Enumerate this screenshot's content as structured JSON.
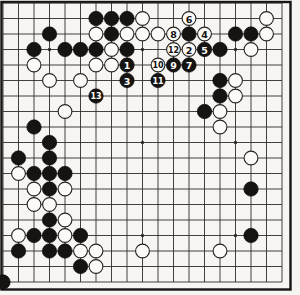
{
  "diagram": {
    "type": "go-board-diagram",
    "board_size": 19,
    "colors": {
      "paper": "#f6f5f1",
      "grid_line": "#2e2c29",
      "frame": "#171513",
      "black_stone": "#161412",
      "white_stone": "#fbfaf7",
      "white_stone_edge": "#25221f",
      "number_on_black": "#ffffff",
      "number_on_white": "#121110"
    },
    "geometry": {
      "origin_x": 3,
      "origin_y": 3,
      "cell": 15.5,
      "stone_radius": 7.2,
      "star_radius": 1.7,
      "frame": {
        "x": 1.5,
        "y": 2,
        "w": 289,
        "h": 287.5
      }
    },
    "star_points": [
      [
        3,
        3
      ],
      [
        9,
        3
      ],
      [
        15,
        3
      ],
      [
        9,
        9
      ],
      [
        15,
        9
      ],
      [
        9,
        15
      ],
      [
        15,
        15
      ]
    ],
    "black_stones": [
      [
        6,
        1
      ],
      [
        7,
        1
      ],
      [
        8,
        1
      ],
      [
        3,
        2
      ],
      [
        7,
        2
      ],
      [
        12,
        2
      ],
      [
        15,
        2
      ],
      [
        16,
        2
      ],
      [
        2,
        3
      ],
      [
        4,
        3
      ],
      [
        5,
        3
      ],
      [
        6,
        3
      ],
      [
        8,
        3
      ],
      [
        14,
        3
      ],
      [
        14,
        5
      ],
      [
        14,
        6
      ],
      [
        13,
        7
      ],
      [
        2,
        8
      ],
      [
        3,
        9
      ],
      [
        1,
        10
      ],
      [
        3,
        10
      ],
      [
        2,
        11
      ],
      [
        3,
        11
      ],
      [
        4,
        11
      ],
      [
        3,
        12
      ],
      [
        16,
        12
      ],
      [
        3,
        14
      ],
      [
        2,
        15
      ],
      [
        3,
        15
      ],
      [
        5,
        15
      ],
      [
        16,
        15
      ],
      [
        1,
        16
      ],
      [
        3,
        16
      ],
      [
        4,
        16
      ],
      [
        5,
        17
      ],
      [
        0,
        18
      ]
    ],
    "white_stones": [
      [
        9,
        1
      ],
      [
        17,
        1
      ],
      [
        6,
        2
      ],
      [
        8,
        2
      ],
      [
        9,
        2
      ],
      [
        10,
        2
      ],
      [
        17,
        2
      ],
      [
        7,
        3
      ],
      [
        16,
        3
      ],
      [
        2,
        4
      ],
      [
        6,
        4
      ],
      [
        7,
        4
      ],
      [
        3,
        5
      ],
      [
        5,
        5
      ],
      [
        15,
        5
      ],
      [
        15,
        6
      ],
      [
        4,
        7
      ],
      [
        14,
        7
      ],
      [
        14,
        8
      ],
      [
        16,
        10
      ],
      [
        1,
        11
      ],
      [
        2,
        12
      ],
      [
        4,
        12
      ],
      [
        2,
        13
      ],
      [
        3,
        13
      ],
      [
        4,
        14
      ],
      [
        1,
        15
      ],
      [
        4,
        15
      ],
      [
        5,
        16
      ],
      [
        6,
        16
      ],
      [
        9,
        16
      ],
      [
        14,
        16
      ],
      [
        6,
        17
      ]
    ],
    "numbered_moves": [
      {
        "n": "1",
        "color": "black",
        "col": 8,
        "row": 4
      },
      {
        "n": "2",
        "color": "white",
        "col": 12,
        "row": 3
      },
      {
        "n": "3",
        "color": "black",
        "col": 8,
        "row": 5
      },
      {
        "n": "4",
        "color": "white",
        "col": 13,
        "row": 2
      },
      {
        "n": "5",
        "color": "black",
        "col": 13,
        "row": 3
      },
      {
        "n": "6",
        "color": "white",
        "col": 12,
        "row": 1
      },
      {
        "n": "7",
        "color": "black",
        "col": 12,
        "row": 4
      },
      {
        "n": "8",
        "color": "white",
        "col": 11,
        "row": 2
      },
      {
        "n": "9",
        "color": "black",
        "col": 11,
        "row": 4
      },
      {
        "n": "10",
        "color": "white",
        "col": 10,
        "row": 4
      },
      {
        "n": "11",
        "color": "black",
        "col": 10,
        "row": 5
      },
      {
        "n": "12",
        "color": "white",
        "col": 11,
        "row": 3
      },
      {
        "n": "13",
        "color": "black",
        "col": 6,
        "row": 6
      }
    ]
  }
}
